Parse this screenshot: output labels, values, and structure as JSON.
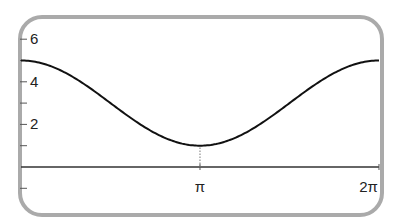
{
  "chart_data": {
    "type": "line",
    "title": "",
    "xlabel": "",
    "ylabel": "",
    "function": "3 + 2cos(x)",
    "xlim": [
      0,
      6.2832
    ],
    "ylim": [
      -1.2,
      6.5
    ],
    "x_ticks": [
      {
        "value": 3.14159,
        "label": "π"
      },
      {
        "value": 6.28318,
        "label": "2π"
      }
    ],
    "y_ticks": [
      {
        "value": 6,
        "label": "6"
      },
      {
        "value": 4,
        "label": "4"
      },
      {
        "value": 2,
        "label": "2"
      }
    ],
    "y_minor_ticks": [
      5,
      3,
      1,
      -1
    ],
    "series": [
      {
        "name": "curve",
        "x": [
          0,
          0.7854,
          1.5708,
          2.3562,
          3.1416,
          3.927,
          4.7124,
          5.4978,
          6.2832
        ],
        "values": [
          5,
          4.41,
          3,
          1.59,
          1,
          1.59,
          3,
          4.41,
          5
        ]
      }
    ],
    "grid": false,
    "legend": "none",
    "annotations": [
      {
        "type": "dotted-vertical",
        "x": 3.14159,
        "from_y": 0,
        "to_y": 1
      }
    ]
  }
}
